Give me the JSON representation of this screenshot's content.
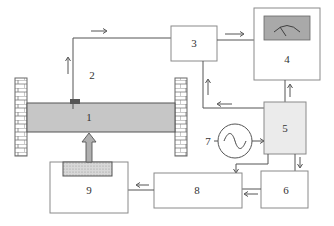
{
  "diagram": {
    "type": "block-diagram",
    "labels": {
      "beam": "1",
      "sensor": "2",
      "conditioner": "3",
      "meter": "4",
      "controller": "5",
      "amplifier": "6",
      "source": "7",
      "driver": "8",
      "actuator": "9"
    },
    "colors": {
      "line": "#555555",
      "box_border": "#8a8a8a",
      "beam_fill": "#c8c8c8",
      "controller_fill": "#ececec",
      "display_fill": "#a8a8a8",
      "actuator_fill": "#d4d4d4"
    }
  }
}
